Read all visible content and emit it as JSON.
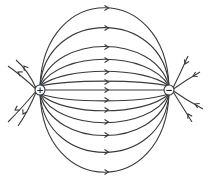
{
  "diagram": {
    "title": "",
    "line_color": "#3a3a3a",
    "background": "#ffffff",
    "charges": [
      {
        "id": "positive",
        "sign": "+",
        "x": 40,
        "y": 90
      },
      {
        "id": "negative",
        "sign": "−",
        "x": 169,
        "y": 90
      }
    ],
    "connecting_lines_apex_y": [
      8,
      28,
      47,
      60,
      72,
      82,
      90,
      100,
      110,
      122,
      135,
      152,
      172
    ],
    "outward_stubs_from_positive": 4,
    "inward_stubs_to_negative": 4,
    "arrow_direction": "from + to −"
  }
}
